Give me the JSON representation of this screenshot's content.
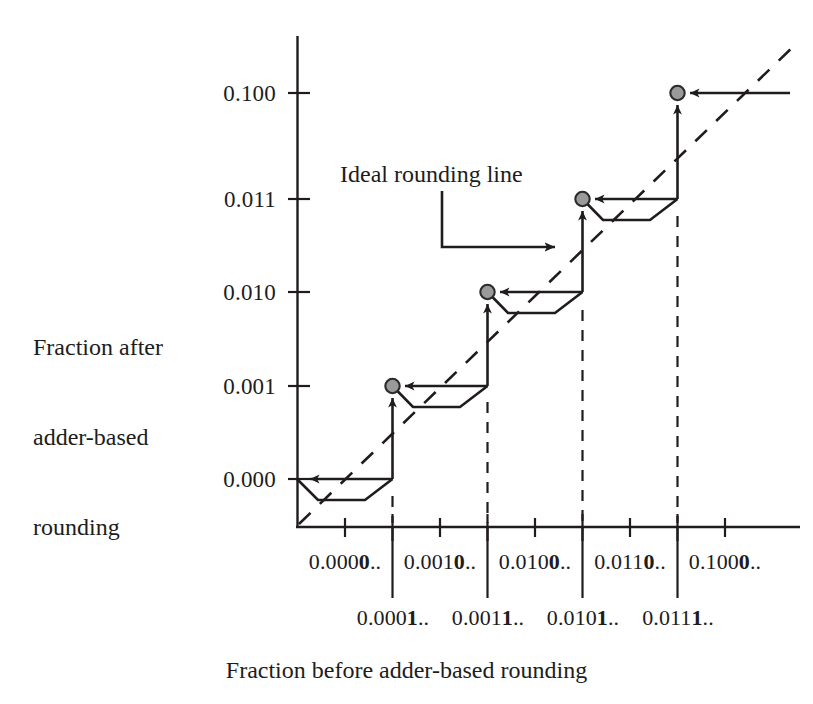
{
  "figure": {
    "title": "",
    "axis_titles": {
      "y_line1": "Fraction after",
      "y_line2": "adder-based",
      "y_line3": "rounding",
      "x": "Fraction before adder-based rounding"
    },
    "annotation": {
      "label": "Ideal rounding line"
    },
    "colors": {
      "ink": "#201c1c",
      "dot_fill": "#9a9a9a",
      "dot_stroke": "#2b2b2b",
      "background": "#ffffff"
    }
  },
  "chart_data": {
    "type": "line",
    "title": "",
    "xlabel": "Fraction before adder-based rounding",
    "ylabel": "Fraction after adder-based rounding",
    "grid": false,
    "legend": "none",
    "annotations": [
      {
        "text": "Ideal rounding line",
        "points_to": "dashed diagonal reference line"
      }
    ],
    "y_tick_labels": [
      "0.000",
      "0.001",
      "0.010",
      "0.011",
      "0.100"
    ],
    "y_tick_values": [
      0,
      1,
      2,
      3,
      4
    ],
    "x_interval_labels": [
      "0.0000..",
      "0.0010..",
      "0.0100..",
      "0.0110..",
      "0.1000.."
    ],
    "x_interval_bold_digit_index": [
      5,
      5,
      5,
      5,
      5
    ],
    "x_boundary_labels": [
      "0.0001..",
      "0.0011..",
      "0.0101..",
      "0.0111.."
    ],
    "x_boundary_bold_digit_index": [
      5,
      5,
      5,
      5
    ],
    "xlim": [
      0,
      9
    ],
    "ylim": [
      -0.55,
      4.6
    ],
    "series": [
      {
        "name": "Adder-based rounding staircase",
        "type": "step",
        "step_levels": [
          0,
          1,
          2,
          3,
          4
        ],
        "step_x_starts": [
          0,
          2,
          4,
          6,
          8
        ],
        "step_x_ends": [
          2,
          4,
          6,
          8,
          9
        ]
      },
      {
        "name": "Ideal rounding line",
        "type": "line",
        "style": "dashed",
        "x": [
          0,
          9
        ],
        "y": [
          -0.45,
          4.6
        ]
      },
      {
        "name": "Rounding error dip",
        "type": "polyline",
        "style": "solid",
        "description": "trapezoidal dip below each step level showing deviation"
      }
    ],
    "markers": {
      "name": "step corner points",
      "shape": "filled-circle",
      "fill": "#9a9a9a",
      "x": [
        0,
        2,
        4,
        6,
        8
      ],
      "y": [
        0,
        1,
        2,
        3,
        4
      ]
    }
  }
}
